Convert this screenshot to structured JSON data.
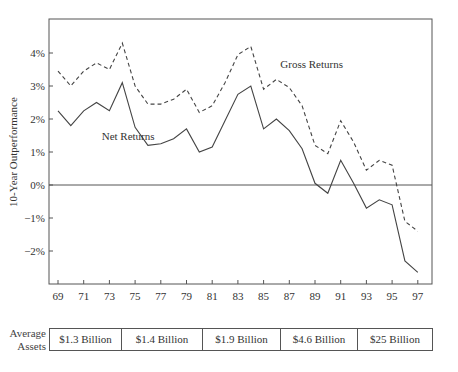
{
  "chart_data": {
    "type": "line",
    "title": "",
    "xlabel": "",
    "ylabel": "10-Year Outperformance",
    "x": [
      69,
      70,
      71,
      72,
      73,
      74,
      75,
      76,
      77,
      78,
      79,
      80,
      81,
      82,
      83,
      84,
      85,
      86,
      87,
      88,
      89,
      90,
      91,
      92,
      93,
      94,
      95,
      96,
      97
    ],
    "x_tick_labels": [
      "69",
      "71",
      "73",
      "75",
      "77",
      "79",
      "81",
      "83",
      "85",
      "87",
      "89",
      "91",
      "93",
      "95",
      "97"
    ],
    "y_tick_labels": [
      "4%",
      "3%",
      "2%",
      "1%",
      "0%",
      "-1%",
      "-2%"
    ],
    "ylim": [
      -3,
      4.7
    ],
    "grid": false,
    "reference_line": 0,
    "series": [
      {
        "name": "Gross Returns",
        "style": "dashed",
        "values": [
          3.45,
          3.0,
          3.45,
          3.7,
          3.5,
          4.3,
          3.0,
          2.45,
          2.45,
          2.6,
          2.9,
          2.2,
          2.4,
          3.1,
          3.95,
          4.2,
          2.9,
          3.2,
          2.95,
          2.4,
          1.2,
          0.95,
          1.95,
          1.3,
          0.45,
          0.75,
          0.6,
          -1.1,
          -1.4
        ]
      },
      {
        "name": "Net Returns",
        "style": "solid",
        "values": [
          2.25,
          1.8,
          2.25,
          2.5,
          2.25,
          3.1,
          1.75,
          1.2,
          1.25,
          1.4,
          1.7,
          1.0,
          1.15,
          1.95,
          2.75,
          3.0,
          1.7,
          2.0,
          1.65,
          1.1,
          0.05,
          -0.25,
          0.75,
          0.05,
          -0.7,
          -0.45,
          -0.6,
          -2.3,
          -2.65
        ]
      }
    ],
    "annotations": [
      {
        "text": "Gross Returns",
        "x": 86.3,
        "y": 3.55
      },
      {
        "text": "Net Returns",
        "x": 72.4,
        "y": 1.35
      }
    ]
  },
  "assets": {
    "label_line1": "Average",
    "label_line2": "Assets",
    "cells": [
      "$1.3 Billion",
      "$1.4 Billion",
      "$1.9 Billion",
      "$4.6 Billion",
      "$25 Billion"
    ]
  }
}
